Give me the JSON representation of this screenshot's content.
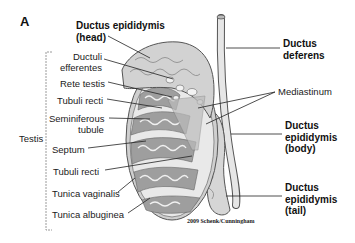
{
  "figure": {
    "panel_letter": "A",
    "credit": "2009 Schenk/Cunningham",
    "colors": {
      "tissue_light": "#d9d9d9",
      "tissue_mid": "#a9a9a9",
      "tissue_dark": "#8a8a8a",
      "outline": "#555555",
      "leader_line": "#222222",
      "bracket": "#9a9a9a"
    }
  },
  "labels": {
    "ductus_epididymis_head": [
      "Ductus epididymis",
      "(head)"
    ],
    "ductuli_efferentes": [
      "Ductuli",
      "efferentes"
    ],
    "rete_testis": "Rete testis",
    "tubuli_recti_top": "Tubuli recti",
    "seminiferous_tubule": [
      "Seminiferous",
      "tubule"
    ],
    "testis": "Testis",
    "septum": "Septum",
    "tubuli_recti_bottom": "Tubuli recti",
    "tunica_vaginalis": "Tunica vaginalis",
    "tunica_albuginea": "Tunica albuginea",
    "ductus_deferens": [
      "Ductus",
      "deferens"
    ],
    "mediastinum": "Mediastinum",
    "ductus_epididymis_body": [
      "Ductus",
      "epididymis",
      "(body)"
    ],
    "ductus_epididymis_tail": [
      "Ductus",
      "epididymis",
      "(tail)"
    ]
  }
}
